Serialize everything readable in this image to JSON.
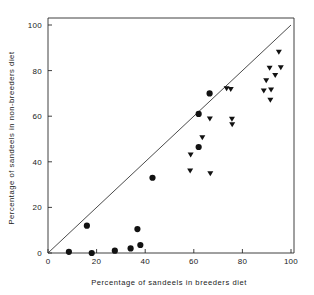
{
  "chart_data": {
    "type": "scatter",
    "title": "",
    "xlabel": "Percentage of sandeels in breeders diet",
    "ylabel": "Percentage of sandeels in non-breeders diet",
    "xlim": [
      0,
      100
    ],
    "ylim": [
      0,
      100
    ],
    "xticks": [
      0,
      20,
      40,
      60,
      80,
      100
    ],
    "yticks": [
      0,
      20,
      40,
      60,
      80,
      100
    ],
    "xticklabels": [
      "0",
      "20",
      "40",
      "60",
      "80",
      "100"
    ],
    "yticklabels": [
      "0",
      "20",
      "40",
      "60",
      "80",
      "100"
    ],
    "grid": false,
    "legend": null,
    "annotations": [
      {
        "kind": "reference-line",
        "label": "1:1 line",
        "from": [
          0,
          0
        ],
        "to": [
          100,
          100
        ]
      }
    ],
    "series": [
      {
        "name": "filled-circle",
        "marker": "circle",
        "color": "#121212",
        "points": [
          [
            8.6,
            0.5
          ],
          [
            16.0,
            12.0
          ],
          [
            18.0,
            0.0
          ],
          [
            27.5,
            1.0
          ],
          [
            34.0,
            2.0
          ],
          [
            36.8,
            10.5
          ],
          [
            38.0,
            3.5
          ],
          [
            43.0,
            33.0
          ],
          [
            62.0,
            46.5
          ],
          [
            62.0,
            61.0
          ],
          [
            66.5,
            70.0
          ]
        ]
      },
      {
        "name": "filled-triangle-down",
        "marker": "triangle-down",
        "color": "#121212",
        "points": [
          [
            58.5,
            36.0
          ],
          [
            58.7,
            43.0
          ],
          [
            63.5,
            50.5
          ],
          [
            66.8,
            34.8
          ],
          [
            66.6,
            58.8
          ],
          [
            73.5,
            72.0
          ],
          [
            75.2,
            71.7
          ],
          [
            75.7,
            58.7
          ],
          [
            75.8,
            56.3
          ],
          [
            88.8,
            71.0
          ],
          [
            89.8,
            75.5
          ],
          [
            91.2,
            81.0
          ],
          [
            91.5,
            67.0
          ],
          [
            91.8,
            71.5
          ],
          [
            93.5,
            77.8
          ],
          [
            95.0,
            88.0
          ],
          [
            95.8,
            81.2
          ]
        ]
      }
    ]
  },
  "axis": {
    "x_title": "Percentage of sandeels in breeders diet",
    "y_title": "Percentage of sandeels in non-breeders diet"
  }
}
